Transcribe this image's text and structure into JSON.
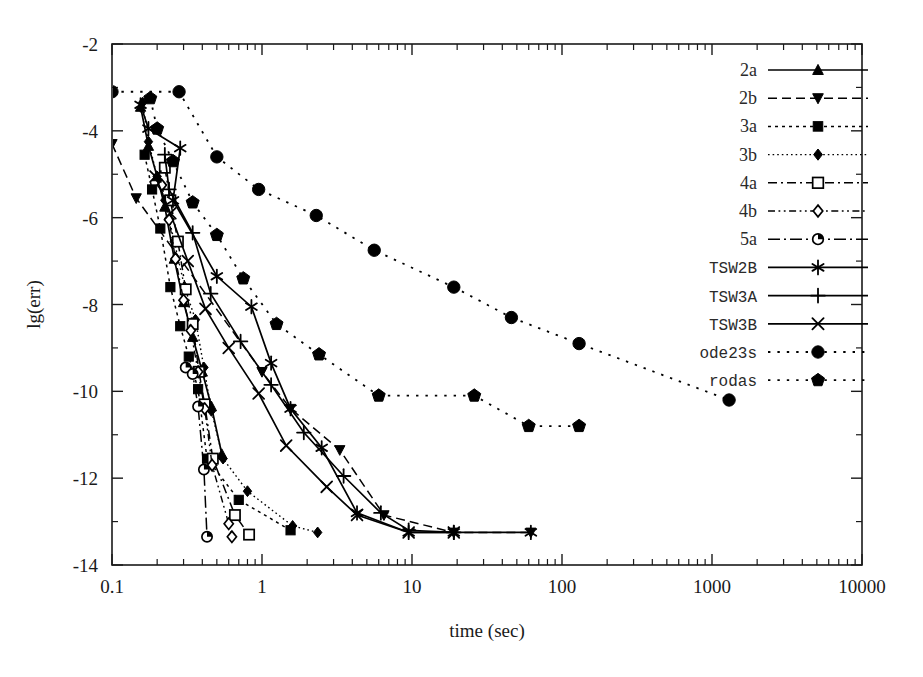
{
  "chart_data": {
    "type": "line",
    "title": "",
    "xlabel": "time (sec)",
    "ylabel": "lg(err)",
    "xscale": "log",
    "yscale": "linear",
    "xlim": [
      0.1,
      10000
    ],
    "ylim": [
      -14,
      -2
    ],
    "grid": false,
    "legend_position": "upper right",
    "x_tick_labels": [
      "0.1",
      "1",
      "10",
      "100",
      "1000",
      "10000"
    ],
    "x_tick_values": [
      0.1,
      1,
      10,
      100,
      1000,
      10000
    ],
    "y_tick_labels": [
      "-2",
      "-4",
      "-6",
      "-8",
      "-10",
      "-12",
      "-14"
    ],
    "y_tick_values": [
      -2,
      -4,
      -6,
      -8,
      -10,
      -12,
      -14
    ],
    "y_minor_ticks": [
      -3,
      -5,
      -7,
      -9,
      -11,
      -13
    ],
    "series": [
      {
        "name": "2a",
        "marker": "triangle-up",
        "filled": true,
        "dash": "solid",
        "points": [
          [
            0.155,
            -3.45
          ],
          [
            0.175,
            -4.35
          ],
          [
            0.2,
            -5.05
          ],
          [
            0.225,
            -5.75
          ],
          [
            0.26,
            -6.95
          ],
          [
            0.3,
            -7.95
          ],
          [
            0.345,
            -8.75
          ],
          [
            0.4,
            -9.55
          ],
          [
            0.46,
            -10.35
          ],
          [
            0.54,
            -11.45
          ]
        ]
      },
      {
        "name": "2b",
        "marker": "triangle-down",
        "filled": true,
        "dash": "dashed",
        "points": [
          [
            0.1,
            -4.3
          ],
          [
            0.145,
            -5.55
          ],
          [
            1.0,
            -9.55
          ],
          [
            1.55,
            -10.4
          ],
          [
            3.3,
            -11.35
          ],
          [
            6.5,
            -12.85
          ],
          [
            19.0,
            -13.25
          ],
          [
            62.0,
            -13.25
          ]
        ]
      },
      {
        "name": "3a",
        "marker": "square",
        "filled": true,
        "dash": "dotted",
        "points": [
          [
            0.165,
            -4.55
          ],
          [
            0.185,
            -5.35
          ],
          [
            0.21,
            -6.25
          ],
          [
            0.245,
            -7.6
          ],
          [
            0.285,
            -8.5
          ],
          [
            0.325,
            -9.2
          ],
          [
            0.375,
            -9.95
          ],
          [
            0.43,
            -11.55
          ],
          [
            0.7,
            -12.5
          ],
          [
            1.55,
            -13.2
          ]
        ]
      },
      {
        "name": "3b",
        "marker": "diamond",
        "filled": true,
        "dash": "dotted-fine",
        "points": [
          [
            0.16,
            -3.35
          ],
          [
            0.175,
            -4.25
          ],
          [
            0.2,
            -5.05
          ],
          [
            0.225,
            -5.6
          ],
          [
            0.26,
            -6.55
          ],
          [
            0.305,
            -7.6
          ],
          [
            0.36,
            -8.35
          ],
          [
            0.41,
            -9.45
          ],
          [
            0.46,
            -10.45
          ],
          [
            0.55,
            -11.55
          ],
          [
            0.8,
            -12.3
          ],
          [
            1.6,
            -13.1
          ],
          [
            2.35,
            -13.25
          ]
        ]
      },
      {
        "name": "4a",
        "marker": "square-open",
        "filled": false,
        "dash": "dashdot",
        "points": [
          [
            0.225,
            -4.85
          ],
          [
            0.245,
            -5.6
          ],
          [
            0.275,
            -6.55
          ],
          [
            0.31,
            -7.65
          ],
          [
            0.345,
            -8.45
          ],
          [
            0.38,
            -9.55
          ],
          [
            0.415,
            -10.3
          ],
          [
            0.47,
            -11.55
          ],
          [
            0.66,
            -12.85
          ],
          [
            0.82,
            -13.3
          ]
        ]
      },
      {
        "name": "4b",
        "marker": "diamond-open",
        "filled": false,
        "dash": "dashdotdot",
        "points": [
          [
            0.215,
            -5.25
          ],
          [
            0.24,
            -6.05
          ],
          [
            0.265,
            -6.95
          ],
          [
            0.3,
            -7.9
          ],
          [
            0.335,
            -8.6
          ],
          [
            0.375,
            -9.55
          ],
          [
            0.415,
            -10.4
          ],
          [
            0.465,
            -11.7
          ],
          [
            0.6,
            -13.05
          ],
          [
            0.63,
            -13.35
          ]
        ]
      },
      {
        "name": "5a",
        "marker": "circle-open",
        "filled": false,
        "dash": "dashdot-long",
        "points": [
          [
            0.31,
            -9.45
          ],
          [
            0.345,
            -9.6
          ],
          [
            0.375,
            -10.35
          ],
          [
            0.41,
            -11.8
          ],
          [
            0.43,
            -13.35
          ]
        ]
      },
      {
        "name": "TSW2B",
        "marker": "asterisk",
        "filled": false,
        "dash": "solid",
        "points": [
          [
            0.155,
            -3.4
          ],
          [
            0.175,
            -3.95
          ],
          [
            0.285,
            -4.4
          ],
          [
            0.255,
            -5.6
          ],
          [
            0.5,
            -7.35
          ],
          [
            0.85,
            -8.05
          ],
          [
            1.15,
            -9.35
          ],
          [
            1.55,
            -10.4
          ],
          [
            2.5,
            -11.3
          ],
          [
            4.3,
            -12.8
          ],
          [
            9.5,
            -13.25
          ],
          [
            19.0,
            -13.25
          ],
          [
            62.0,
            -13.25
          ]
        ]
      },
      {
        "name": "TSW3A",
        "marker": "plus",
        "filled": false,
        "dash": "solid",
        "points": [
          [
            0.225,
            -4.55
          ],
          [
            0.24,
            -5.35
          ],
          [
            0.345,
            -6.35
          ],
          [
            0.455,
            -7.75
          ],
          [
            0.72,
            -8.85
          ],
          [
            1.15,
            -9.85
          ],
          [
            1.9,
            -10.95
          ],
          [
            3.5,
            -11.95
          ],
          [
            6.2,
            -12.8
          ],
          [
            9.5,
            -13.2
          ],
          [
            19.0,
            -13.25
          ]
        ]
      },
      {
        "name": "TSW3B",
        "marker": "cross",
        "filled": false,
        "dash": "solid",
        "points": [
          [
            0.195,
            -5.05
          ],
          [
            0.245,
            -5.9
          ],
          [
            0.32,
            -7.0
          ],
          [
            0.42,
            -8.1
          ],
          [
            0.6,
            -9.0
          ],
          [
            0.95,
            -10.05
          ],
          [
            1.45,
            -11.25
          ],
          [
            2.7,
            -12.2
          ],
          [
            4.3,
            -12.85
          ],
          [
            9.5,
            -13.25
          ],
          [
            19.0,
            -13.25
          ]
        ]
      },
      {
        "name": "ode23s",
        "marker": "circle",
        "filled": true,
        "dash": "sparse-dotted",
        "points": [
          [
            0.1,
            -3.1
          ],
          [
            0.28,
            -3.1
          ],
          [
            0.5,
            -4.6
          ],
          [
            0.95,
            -5.35
          ],
          [
            2.3,
            -5.95
          ],
          [
            5.6,
            -6.75
          ],
          [
            19.0,
            -7.6
          ],
          [
            46.0,
            -8.3
          ],
          [
            130.0,
            -8.9
          ],
          [
            1300.0,
            -10.2
          ]
        ]
      },
      {
        "name": "rodas",
        "marker": "pentagon",
        "filled": true,
        "dash": "sparse-dotted",
        "points": [
          [
            0.18,
            -3.25
          ],
          [
            0.2,
            -3.95
          ],
          [
            0.255,
            -4.7
          ],
          [
            0.345,
            -5.65
          ],
          [
            0.5,
            -6.4
          ],
          [
            0.75,
            -7.4
          ],
          [
            1.25,
            -8.45
          ],
          [
            2.4,
            -9.15
          ],
          [
            6.0,
            -10.1
          ],
          [
            26.0,
            -10.1
          ],
          [
            60.0,
            -10.8
          ],
          [
            130.0,
            -10.8
          ]
        ]
      }
    ]
  },
  "axes": {
    "x_title": "time (sec)",
    "y_title": "lg(err)"
  },
  "legend": {
    "entries": [
      {
        "label": "2a",
        "marker": "triangle-up",
        "dash": "solid",
        "mono": false
      },
      {
        "label": "2b",
        "marker": "triangle-down",
        "dash": "dashed",
        "mono": false
      },
      {
        "label": "3a",
        "marker": "square",
        "dash": "dotted",
        "mono": false
      },
      {
        "label": "3b",
        "marker": "diamond",
        "dash": "dotted-fine",
        "mono": false
      },
      {
        "label": "4a",
        "marker": "square-open",
        "dash": "dashdot",
        "mono": false
      },
      {
        "label": "4b",
        "marker": "diamond-open",
        "dash": "dashdotdot",
        "mono": false
      },
      {
        "label": "5a",
        "marker": "circle-open",
        "dash": "dashdot-long",
        "mono": false
      },
      {
        "label": "TSW2B",
        "marker": "asterisk",
        "dash": "solid",
        "mono": true
      },
      {
        "label": "TSW3A",
        "marker": "plus",
        "dash": "solid",
        "mono": true
      },
      {
        "label": "TSW3B",
        "marker": "cross",
        "dash": "solid",
        "mono": true
      },
      {
        "label": "ode23s",
        "marker": "circle",
        "dash": "sparse-dotted",
        "mono": true
      },
      {
        "label": "rodas",
        "marker": "pentagon",
        "dash": "sparse-dotted",
        "mono": true
      }
    ]
  }
}
